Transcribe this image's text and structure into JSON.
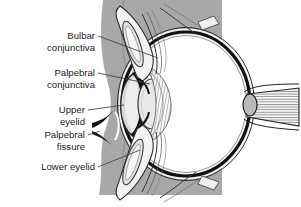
{
  "figure": {
    "background_color": "#ffffff",
    "orbital_band_color": "#a8a8a8",
    "sclera_color": "#1a1a1a",
    "cornea_color": "#d8d8d8",
    "lens_color": "#e6e6e6",
    "iris_color": "#141414",
    "vitreous_color": "#ffffff",
    "text_color": "#1b1b1b",
    "leader_color": "#3a3a3a"
  },
  "labels": [
    {
      "id": "bulbar-conjunctiva",
      "line1": "Bulbar",
      "line2": "conjunctiva"
    },
    {
      "id": "palpebral-conjunctiva",
      "line1": "Palpebral",
      "line2": "conjunctiva"
    },
    {
      "id": "upper-eyelid",
      "line1": "Upper",
      "line2": "eyelid"
    },
    {
      "id": "palpebral-fissure",
      "line1": "Palpebral",
      "line2": "fissure"
    },
    {
      "id": "lower-eyelid",
      "line1": "Lower eyelid",
      "line2": ""
    }
  ],
  "structures": [
    {
      "id": "orbital-tissue",
      "name": "Orbital soft tissue band"
    },
    {
      "id": "upper-eyelid",
      "name": "Upper eyelid with tarsal plate"
    },
    {
      "id": "lower-eyelid",
      "name": "Lower eyelid with tarsal plate"
    },
    {
      "id": "palpebral-fissure-gap",
      "name": "Palpebral fissure opening"
    },
    {
      "id": "cornea",
      "name": "Cornea"
    },
    {
      "id": "anterior-chamber",
      "name": "Anterior chamber"
    },
    {
      "id": "iris",
      "name": "Iris"
    },
    {
      "id": "lens",
      "name": "Lens"
    },
    {
      "id": "ciliary-body",
      "name": "Ciliary body and zonules"
    },
    {
      "id": "sclera",
      "name": "Sclera"
    },
    {
      "id": "vitreous-chamber",
      "name": "Vitreous chamber"
    },
    {
      "id": "optic-nerve",
      "name": "Optic nerve"
    }
  ]
}
